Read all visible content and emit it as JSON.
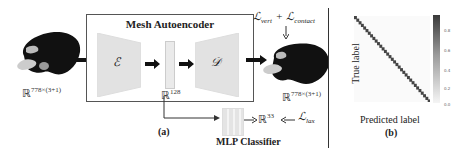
{
  "panel_a": {
    "caption": "(a)",
    "box_title": "Mesh Autoencoder",
    "encoder_symbol": "ℰ",
    "decoder_symbol": "𝒟",
    "input_dim": {
      "base": "ℝ",
      "exp": "778×(3+1)"
    },
    "latent_dim": {
      "base": "ℝ",
      "exp": "128"
    },
    "output_dim": {
      "base": "ℝ",
      "exp": "778×(3+1)"
    },
    "classifier_label": "MLP Classifier",
    "classifier_out": {
      "base": "ℝ",
      "exp": "33"
    },
    "loss_recon": "ℒ",
    "loss_recon_sub1": "vert",
    "loss_plus": "+",
    "loss_recon2": "ℒ",
    "loss_recon_sub2": "contact",
    "loss_cls": "ℒ",
    "loss_cls_sub": "lax"
  },
  "panel_b": {
    "caption": "(b)",
    "xlabel": "Predicted label",
    "ylabel": "True label",
    "colorbar_ticks": [
      "0.8",
      "0.6",
      "0.4",
      "0.2",
      "0.0"
    ]
  },
  "chart_data": {
    "type": "heatmap",
    "xlabel": "Predicted label",
    "ylabel": "True label",
    "n_classes": 33,
    "diagonal_value": 0.95,
    "off_diagonal_value": 0.0,
    "colorbar_range": [
      0.0,
      0.95
    ],
    "colorbar_ticks": [
      0.0,
      0.2,
      0.4,
      0.6,
      0.8
    ]
  }
}
